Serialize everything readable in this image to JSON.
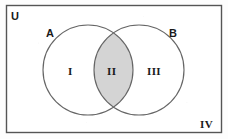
{
  "figure": {
    "type": "venn-diagram",
    "title": "",
    "background_color": "#fdfdfd",
    "universe": {
      "label": "U",
      "border_color": "#555555",
      "fill_color": "#ffffff",
      "rect": {
        "x": 6,
        "y": 5,
        "width": 216,
        "height": 128
      }
    },
    "sets": [
      {
        "label": "A",
        "stroke_color": "#666666",
        "fill_color": "none",
        "circle": {
          "cx": 88,
          "cy": 70,
          "r": 45
        },
        "label_pos": {
          "x": 46,
          "y": 28
        }
      },
      {
        "label": "B",
        "stroke_color": "#666666",
        "fill_color": "none",
        "circle": {
          "cx": 139,
          "cy": 70,
          "r": 45
        },
        "label_pos": {
          "x": 169,
          "y": 28
        }
      }
    ],
    "regions": [
      {
        "label": "I",
        "meaning": "A only",
        "shaded": false,
        "fill_color": "#ffffff",
        "label_pos": {
          "x": 68,
          "y": 66
        }
      },
      {
        "label": "II",
        "meaning": "A and B",
        "shaded": true,
        "fill_color": "#d4d4d4",
        "label_pos": {
          "x": 107,
          "y": 66
        }
      },
      {
        "label": "III",
        "meaning": "B only",
        "shaded": false,
        "fill_color": "#ffffff",
        "label_pos": {
          "x": 147,
          "y": 66
        }
      },
      {
        "label": "IV",
        "meaning": "outside A and B",
        "shaded": false,
        "fill_color": "#ffffff",
        "label_pos": {
          "x": 200,
          "y": 119
        }
      }
    ]
  }
}
